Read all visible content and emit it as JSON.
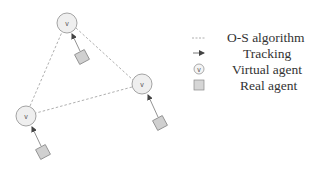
{
  "diagram": {
    "virtual_agents": [
      {
        "id": "top",
        "label": "v",
        "cx": 67,
        "cy": 23,
        "r": 10
      },
      {
        "id": "right",
        "label": "v",
        "cx": 142,
        "cy": 84,
        "r": 10
      },
      {
        "id": "left",
        "label": "v",
        "cx": 26,
        "cy": 116,
        "r": 10
      }
    ],
    "real_agents": [
      {
        "id": "top",
        "cx": 82,
        "cy": 57,
        "size": 11,
        "tracks": "top"
      },
      {
        "id": "right",
        "cx": 160,
        "cy": 123,
        "size": 11,
        "tracks": "right"
      },
      {
        "id": "left",
        "cx": 43,
        "cy": 152,
        "size": 11,
        "tracks": "left"
      }
    ],
    "os_links": [
      [
        "top",
        "right"
      ],
      [
        "right",
        "left"
      ],
      [
        "left",
        "top"
      ]
    ]
  },
  "legend": {
    "items": [
      {
        "icon": "dashed-line-icon",
        "label": "O-S algorithm"
      },
      {
        "icon": "arrow-icon",
        "label": "Tracking"
      },
      {
        "icon": "virtual-agent-icon",
        "label": "Virtual agent",
        "glyph": "v"
      },
      {
        "icon": "real-agent-icon",
        "label": "Real agent"
      }
    ]
  },
  "colors": {
    "circle_fill": "#efefef",
    "circle_stroke": "#9a9a9a",
    "square_fill": "#d0d0d0",
    "square_stroke": "#8a8a8a",
    "dashed_line": "#9a9a9a",
    "arrow": "#555555",
    "text": "#333333"
  }
}
